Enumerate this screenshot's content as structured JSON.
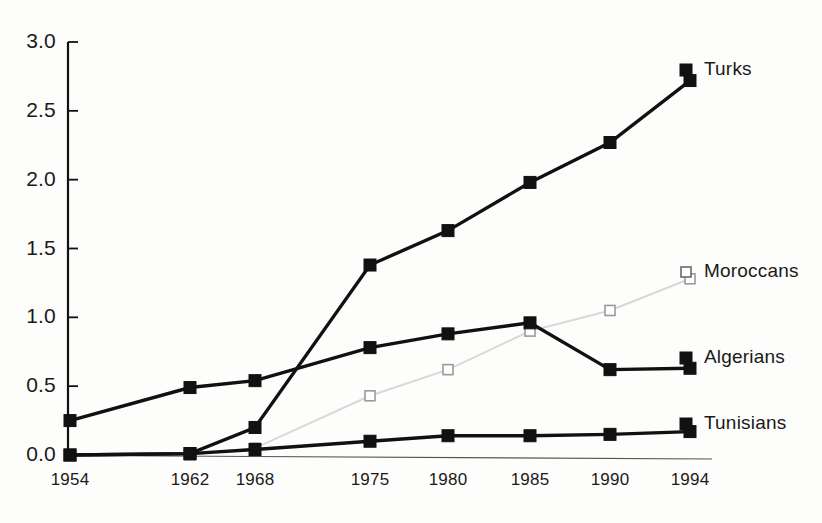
{
  "chart_data": {
    "type": "line",
    "title": "",
    "xlabel": "",
    "ylabel": "",
    "categories": [
      "1954",
      "1962",
      "1968",
      "1975",
      "1980",
      "1985",
      "1990",
      "1994"
    ],
    "x_positions": [
      70,
      190,
      255,
      370,
      448,
      530,
      610,
      690
    ],
    "ylim": [
      0.0,
      3.0
    ],
    "yticks": [
      "0.0",
      "0.5",
      "1.0",
      "1.5",
      "2.0",
      "2.5",
      "3.0"
    ],
    "ytick_values": [
      0.0,
      0.5,
      1.0,
      1.5,
      2.0,
      2.5,
      3.0
    ],
    "grid": false,
    "legend_position": "right-inline",
    "series": [
      {
        "name": "Turks",
        "marker": "filled-square",
        "color": "#111111",
        "line_style": "solid-thick",
        "values": [
          0.0,
          0.01,
          0.2,
          1.38,
          1.63,
          1.98,
          2.27,
          2.72
        ],
        "label_y": 70
      },
      {
        "name": "Moroccans",
        "marker": "open-square",
        "color": "#d8d8d8",
        "line_style": "solid-thin-light",
        "values": [
          null,
          0.0,
          0.05,
          0.43,
          0.62,
          0.9,
          1.05,
          1.28
        ],
        "label_y": 272
      },
      {
        "name": "Algerians",
        "marker": "filled-square",
        "color": "#111111",
        "line_style": "solid-thick",
        "values": [
          0.25,
          0.49,
          0.54,
          0.78,
          0.88,
          0.96,
          0.62,
          0.63
        ],
        "label_y": 358
      },
      {
        "name": "Tunisians",
        "marker": "filled-square",
        "color": "#111111",
        "line_style": "solid-thick",
        "values": [
          0.0,
          0.01,
          0.04,
          0.1,
          0.14,
          0.14,
          0.15,
          0.17
        ],
        "label_y": 424
      }
    ]
  },
  "axis": {
    "y_axis_color": "#111111",
    "x_axis_color": "#555555",
    "tick_direction": "inward"
  }
}
